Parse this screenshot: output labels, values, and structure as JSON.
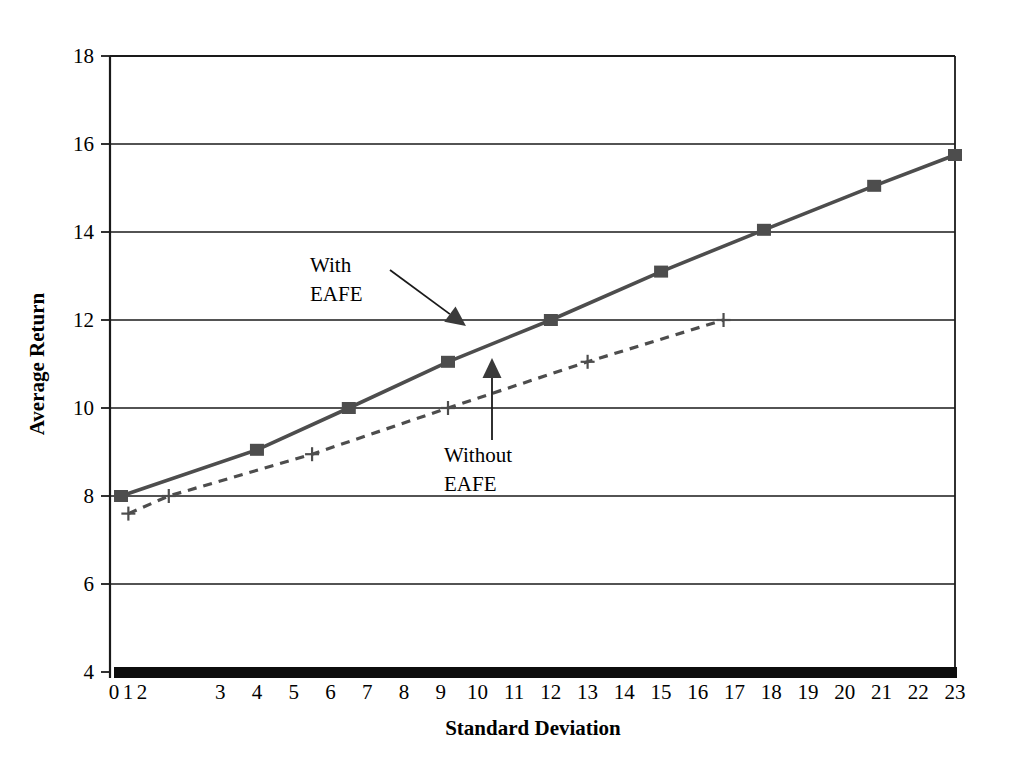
{
  "chart_data": {
    "type": "line",
    "title": "",
    "xlabel": "Standard Deviation",
    "ylabel": "Average Return",
    "xlim": [
      0,
      23
    ],
    "ylim": [
      4,
      18
    ],
    "grid": true,
    "legend_position": "inline-annotations",
    "x_tick_labels": [
      "0",
      "1",
      "2",
      "3",
      "4",
      "5",
      "6",
      "7",
      "8",
      "9",
      "10",
      "11",
      "12",
      "13",
      "14",
      "15",
      "16",
      "17",
      "18",
      "19",
      "20",
      "21",
      "22",
      "23"
    ],
    "y_tick_labels": [
      "4",
      "6",
      "8",
      "10",
      "12",
      "14",
      "16",
      "18"
    ],
    "y_ticks": [
      4,
      6,
      8,
      10,
      12,
      14,
      16,
      18
    ],
    "series": [
      {
        "name": "With EAFE",
        "marker": "square",
        "line_style": "solid",
        "color": "#4d4d4d",
        "points": [
          {
            "x": 0.3,
            "y": 8.0
          },
          {
            "x": 4.0,
            "y": 9.05
          },
          {
            "x": 6.5,
            "y": 10.0
          },
          {
            "x": 9.2,
            "y": 11.05
          },
          {
            "x": 12.0,
            "y": 12.0
          },
          {
            "x": 15.0,
            "y": 13.1
          },
          {
            "x": 17.8,
            "y": 14.05
          },
          {
            "x": 20.8,
            "y": 15.05
          },
          {
            "x": 23.0,
            "y": 15.75
          }
        ]
      },
      {
        "name": "Without EAFE",
        "marker": "plus",
        "line_style": "dashed",
        "color": "#4d4d4d",
        "points": [
          {
            "x": 0.5,
            "y": 7.6
          },
          {
            "x": 1.6,
            "y": 8.0
          },
          {
            "x": 5.5,
            "y": 8.95
          },
          {
            "x": 9.2,
            "y": 10.0
          },
          {
            "x": 13.0,
            "y": 11.05
          },
          {
            "x": 16.7,
            "y": 12.0
          }
        ]
      }
    ],
    "annotations": [
      {
        "name": "with-eafe",
        "lines": [
          "With",
          "EAFE"
        ],
        "text_x": 310,
        "text_y": 272,
        "arrow_from_x": 390,
        "arrow_from_y": 270,
        "arrow_to_x": 466,
        "arrow_to_y": 326
      },
      {
        "name": "without-eafe",
        "lines": [
          "Without",
          "EAFE"
        ],
        "text_x": 444,
        "text_y": 462,
        "arrow_from_x": 492,
        "arrow_from_y": 440,
        "arrow_to_x": 492,
        "arrow_to_y": 358
      }
    ]
  },
  "axes": {
    "x_title": "Standard Deviation",
    "y_title": "Average Return"
  },
  "colors": {
    "series_gray": "#4d4d4d",
    "axis_black": "#1a1a1a",
    "background": "#ffffff"
  }
}
